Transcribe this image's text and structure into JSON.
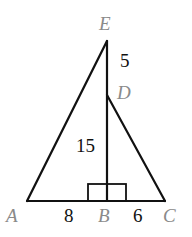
{
  "diagram": {
    "points": {
      "A": {
        "label": "A"
      },
      "B": {
        "label": "B"
      },
      "C": {
        "label": "C"
      },
      "D": {
        "label": "D"
      },
      "E": {
        "label": "E"
      }
    },
    "lengths": {
      "ED": "5",
      "DB": "15",
      "AB": "8",
      "BC": "6"
    },
    "right_angle_at": "B",
    "colors": {
      "line": "#111111",
      "point_label": "#8a8a8a",
      "number_label": "#111111"
    }
  }
}
